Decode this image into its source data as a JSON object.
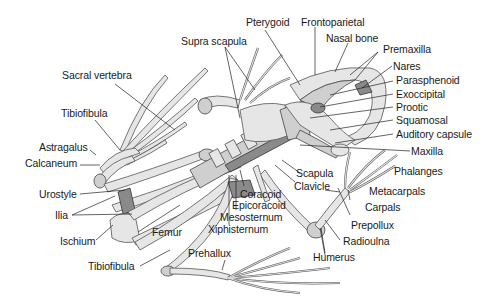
{
  "diagram": {
    "colors": {
      "background": "#ffffff",
      "bone_light": "#e6e6e6",
      "bone_shadow": "#8a8a8a",
      "label_text": "#1a1a1a",
      "leader_line": "#222222"
    },
    "labels": {
      "pterygoid": "Pterygoid",
      "frontoparietal": "Frontoparietal",
      "supra_scapula": "Supra scapula",
      "nasal_bone": "Nasal bone",
      "premaxilla": "Premaxilla",
      "nares": "Nares",
      "parasphenoid": "Parasphenoid",
      "exoccipital": "Exoccipital",
      "prootic": "Prootic",
      "squamosal": "Squamosal",
      "auditory_capsule": "Auditory capsule",
      "maxilla": "Maxilla",
      "phalanges": "Phalanges",
      "metacarpals": "Metacarpals",
      "carpals": "Carpals",
      "prepollux": "Prepollux",
      "radioulna": "Radioulna",
      "humerus": "Humerus",
      "scapula": "Scapula",
      "clavicle": "Clavicle",
      "coracoid": "Coracoid",
      "epicoracoid": "Epicoracoid",
      "mesosternum": "Mesosternum",
      "xiphisternum": "Xiphisternum",
      "prehallux": "Prehallux",
      "sacral_vertebra": "Sacral vertebra",
      "tibiofibula_upper": "Tibiofibula",
      "astragalus": "Astragalus",
      "calcaneum": "Calcaneum",
      "urostyle": "Urostyle",
      "ilia": "Ilia",
      "ischium": "Ischium",
      "femur": "Femur",
      "tibiofibula_lower": "Tibiofibula"
    }
  }
}
